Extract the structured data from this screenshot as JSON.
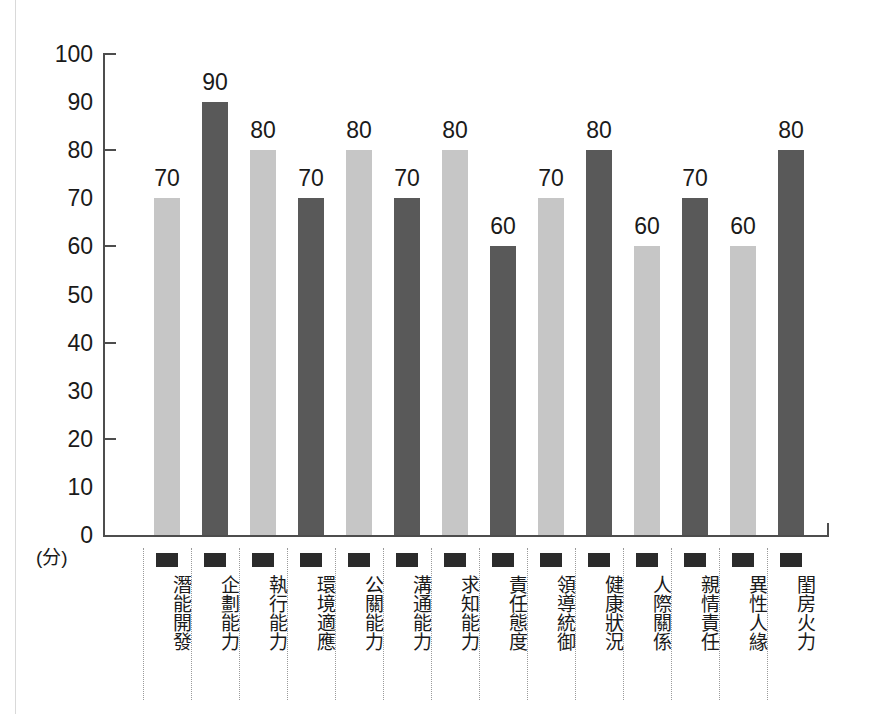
{
  "chart_data": {
    "type": "bar",
    "title": "",
    "xlabel": "",
    "ylabel": "(分)",
    "ylim": [
      0,
      100
    ],
    "grid": false,
    "legend_position": "none",
    "tick_step": 10,
    "tick_mark_step": 20,
    "y_tick_labels": [
      "100",
      "90",
      "80",
      "70",
      "60",
      "50",
      "40",
      "30",
      "20",
      "10",
      "0"
    ],
    "y_tick_values": [
      100,
      90,
      80,
      70,
      60,
      50,
      40,
      30,
      20,
      10,
      0
    ],
    "categories": [
      "潛能開發",
      "企劃能力",
      "執行能力",
      "環境適應",
      "公關能力",
      "溝通能力",
      "求知能力",
      "責任態度",
      "領導統御",
      "健康狀況",
      "人際關係",
      "親情責任",
      "異性人緣",
      "閨房火力"
    ],
    "values": [
      70,
      90,
      80,
      70,
      80,
      70,
      80,
      60,
      70,
      80,
      60,
      70,
      60,
      80
    ],
    "bar_shades": [
      "light",
      "dark",
      "light",
      "dark",
      "light",
      "dark",
      "light",
      "dark",
      "light",
      "dark",
      "light",
      "dark",
      "light",
      "dark"
    ],
    "colors": {
      "bar_light": "#c6c6c6",
      "bar_dark": "#595959",
      "axis": "#4d4d4d",
      "text": "#1a1a1a",
      "marker": "#2b2b2b",
      "divider": "#9a9a9a",
      "background": "#ffffff"
    }
  },
  "axis": {
    "unit_label": "(分)"
  }
}
